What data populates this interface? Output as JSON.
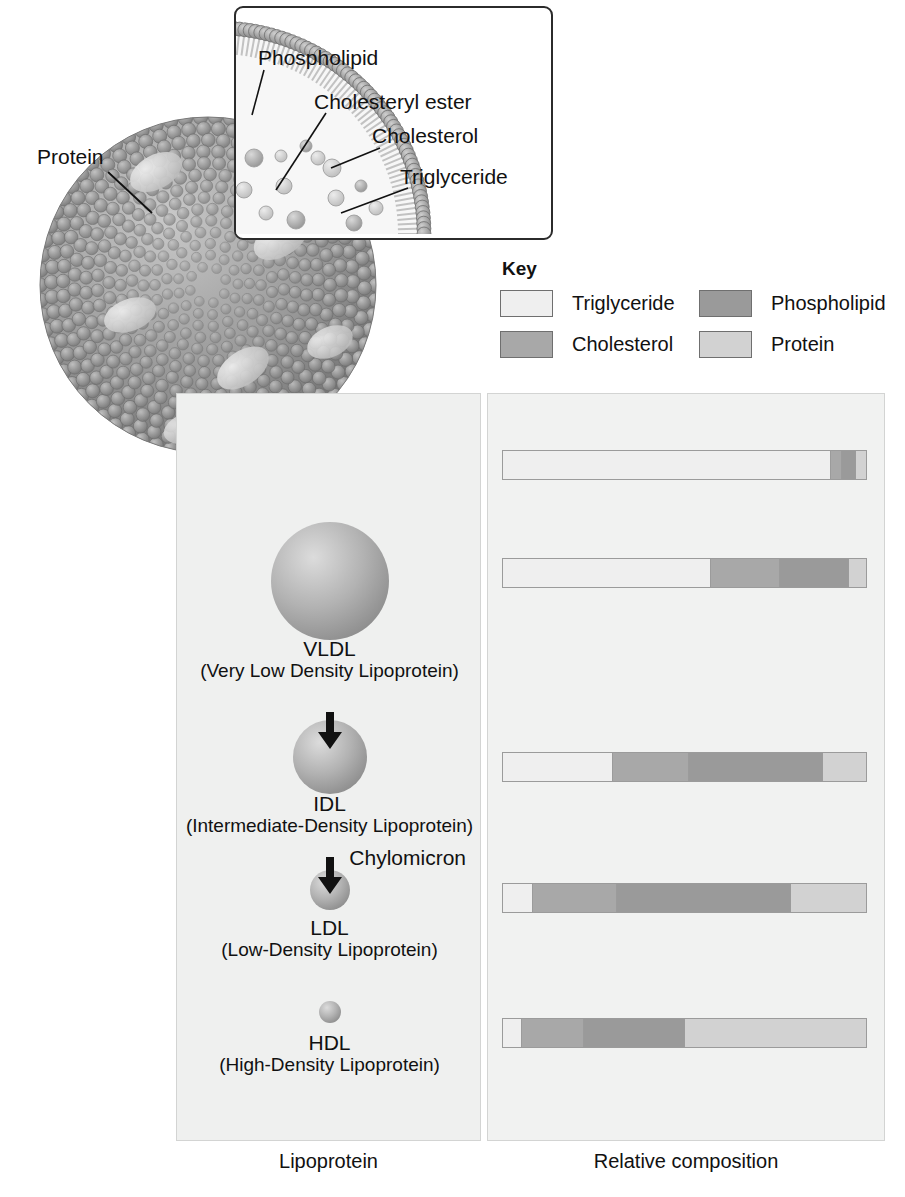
{
  "inset": {
    "labels": [
      {
        "key": "phospholipid",
        "text": "Phospholipid"
      },
      {
        "key": "cholesteryl_ester",
        "text": "Cholesteryl ester"
      },
      {
        "key": "cholesterol",
        "text": "Cholesterol"
      },
      {
        "key": "triglyceride",
        "text": "Triglyceride"
      }
    ]
  },
  "sphere_callout": {
    "protein_label": "Protein"
  },
  "key": {
    "title": "Key",
    "items": [
      {
        "label": "Triglyceride",
        "color": "#efefef"
      },
      {
        "label": "Phospholipid",
        "color": "#9a9a9a"
      },
      {
        "label": "Cholesterol",
        "color": "#a8a8a8"
      },
      {
        "label": "Protein",
        "color": "#d2d2d2"
      }
    ]
  },
  "captions": {
    "left": "Lipoprotein",
    "right": "Relative composition"
  },
  "colors": {
    "triglyceride": "#efefef",
    "cholesterol": "#a8a8a8",
    "phospholipid": "#9a9a9a",
    "protein": "#d2d2d2",
    "panel_left_bg": "#eff0ef",
    "panel_right_bg": "#f1f2f1",
    "outline": "#9b9b9b",
    "text": "#1a1a1a"
  },
  "chart_data": {
    "type": "bar",
    "title": "Relative composition",
    "orientation": "horizontal-stacked",
    "xlabel": "Relative composition",
    "ylabel": "Lipoprotein",
    "categories": [
      "Chylomicron",
      "VLDL",
      "IDL",
      "LDL",
      "HDL"
    ],
    "legend": [
      "Triglyceride",
      "Cholesterol",
      "Phospholipid",
      "Protein"
    ],
    "legend_position": "top-right",
    "grid": false,
    "units": "percent of particle mass",
    "series": [
      {
        "name": "Triglyceride",
        "color": "#efefef",
        "values": [
          90,
          57,
          30,
          8,
          5
        ]
      },
      {
        "name": "Cholesterol",
        "color": "#a8a8a8",
        "values": [
          3,
          19,
          21,
          23,
          17
        ]
      },
      {
        "name": "Phospholipid",
        "color": "#9a9a9a",
        "values": [
          4,
          19,
          37,
          48,
          28
        ]
      },
      {
        "name": "Protein",
        "color": "#d2d2d2",
        "values": [
          3,
          5,
          12,
          21,
          50
        ]
      }
    ]
  },
  "lipoproteins": [
    {
      "abbr": "Chylomicron",
      "full": "",
      "sphere_diameter_px": 0,
      "segments": [
        {
          "component": "Triglyceride",
          "pct": 90
        },
        {
          "component": "Cholesterol",
          "pct": 3
        },
        {
          "component": "Phospholipid",
          "pct": 4
        },
        {
          "component": "Protein",
          "pct": 3
        }
      ]
    },
    {
      "abbr": "VLDL",
      "full": "(Very Low Density Lipoprotein)",
      "sphere_diameter_px": 118,
      "segments": [
        {
          "component": "Triglyceride",
          "pct": 57
        },
        {
          "component": "Cholesterol",
          "pct": 19
        },
        {
          "component": "Phospholipid",
          "pct": 19
        },
        {
          "component": "Protein",
          "pct": 5
        }
      ]
    },
    {
      "abbr": "IDL",
      "full": "(Intermediate-Density Lipoprotein)",
      "sphere_diameter_px": 74,
      "segments": [
        {
          "component": "Triglyceride",
          "pct": 30
        },
        {
          "component": "Cholesterol",
          "pct": 21
        },
        {
          "component": "Phospholipid",
          "pct": 37
        },
        {
          "component": "Protein",
          "pct": 12
        }
      ]
    },
    {
      "abbr": "LDL",
      "full": "(Low-Density Lipoprotein)",
      "sphere_diameter_px": 40,
      "segments": [
        {
          "component": "Triglyceride",
          "pct": 8
        },
        {
          "component": "Cholesterol",
          "pct": 23
        },
        {
          "component": "Phospholipid",
          "pct": 48
        },
        {
          "component": "Protein",
          "pct": 21
        }
      ]
    },
    {
      "abbr": "HDL",
      "full": "(High-Density Lipoprotein)",
      "sphere_diameter_px": 22,
      "segments": [
        {
          "component": "Triglyceride",
          "pct": 5
        },
        {
          "component": "Cholesterol",
          "pct": 17
        },
        {
          "component": "Phospholipid",
          "pct": 28
        },
        {
          "component": "Protein",
          "pct": 50
        }
      ]
    }
  ]
}
